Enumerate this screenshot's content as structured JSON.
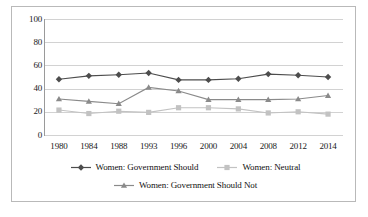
{
  "chart_data": {
    "type": "line",
    "title": "",
    "subtitle": "",
    "xlabel": "",
    "ylabel": "",
    "categories": [
      "1980",
      "1984",
      "1988",
      "1993",
      "1996",
      "2000",
      "2004",
      "2008",
      "2012",
      "2014"
    ],
    "ylim": [
      0,
      100
    ],
    "yticks": [
      0,
      20,
      40,
      60,
      80,
      100
    ],
    "ytick_labels": [
      "0",
      "20",
      "40",
      "60",
      "80",
      "100"
    ],
    "grid": true,
    "legend_position": "bottom",
    "series": [
      {
        "name": "Women: Government Should",
        "color": "#4d4d4d",
        "marker": "diamond",
        "values": [
          48,
          51,
          52,
          53.5,
          47.5,
          47.5,
          48.5,
          52.5,
          51.5,
          50
        ]
      },
      {
        "name": "Women: Neutral",
        "color": "#c2c2c2",
        "marker": "square",
        "values": [
          21.5,
          18.5,
          20.5,
          19.5,
          23.5,
          23.5,
          22.5,
          19,
          20,
          18
        ]
      },
      {
        "name": "Women: Government Should Not",
        "color": "#8a8a8a",
        "marker": "triangle",
        "values": [
          31,
          29,
          27,
          41,
          38,
          30.5,
          30.5,
          30.5,
          31,
          34
        ]
      }
    ]
  },
  "legend": {
    "items": [
      {
        "label": "Women: Government Should",
        "color": "#4d4d4d",
        "marker": "diamond"
      },
      {
        "label": "Women: Neutral",
        "color": "#c2c2c2",
        "marker": "square"
      },
      {
        "label": "Women: Government Should Not",
        "color": "#8a8a8a",
        "marker": "triangle"
      }
    ]
  }
}
